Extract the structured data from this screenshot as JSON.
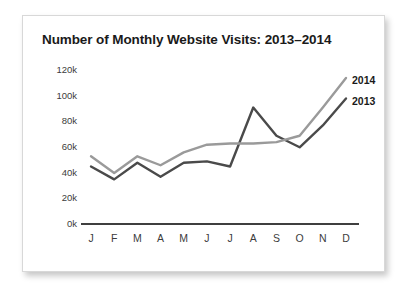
{
  "chart_data": {
    "type": "line",
    "title": "Number of Monthly Website Visits: 2013–2014",
    "xlabel": "",
    "ylabel": "",
    "categories": [
      "J",
      "F",
      "M",
      "A",
      "M",
      "J",
      "J",
      "A",
      "S",
      "O",
      "N",
      "D"
    ],
    "ylim": [
      0,
      120000
    ],
    "yticks": [
      0,
      20000,
      40000,
      60000,
      80000,
      100000,
      120000
    ],
    "ytick_labels": [
      "0k",
      "20k",
      "40k",
      "60k",
      "80k",
      "100k",
      "120k"
    ],
    "grid": false,
    "legend_position": "right-end-of-line",
    "series": [
      {
        "name": "2013",
        "color": "#4a4a4a",
        "values": [
          44000,
          34000,
          47000,
          36000,
          47000,
          48000,
          44000,
          90000,
          68000,
          59000,
          76000,
          97000
        ]
      },
      {
        "name": "2014",
        "color": "#9a9a9a",
        "values": [
          52000,
          39000,
          52000,
          45000,
          55000,
          61000,
          62000,
          62000,
          63000,
          68000,
          90000,
          113000
        ]
      }
    ]
  },
  "card": {
    "title": "Number of Monthly Website Visits: 2013–2014"
  }
}
